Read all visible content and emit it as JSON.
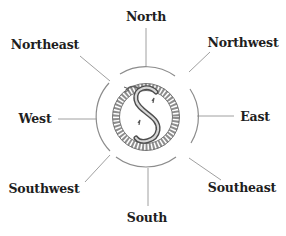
{
  "diagram": {
    "type": "compass-rose",
    "center_emblem": "ouroboros-serpent-s-icon",
    "labels": {
      "north": "North",
      "northeast": "Northeast",
      "northwest": "Northwest",
      "west": "West",
      "east": "East",
      "southwest": "Southwest",
      "southeast": "Southeast",
      "south": "South"
    },
    "colors": {
      "text": "#1e1e1e",
      "lines": "#9a9a9a",
      "emblem": "#6e6e6e",
      "background": "#ffffff"
    }
  }
}
